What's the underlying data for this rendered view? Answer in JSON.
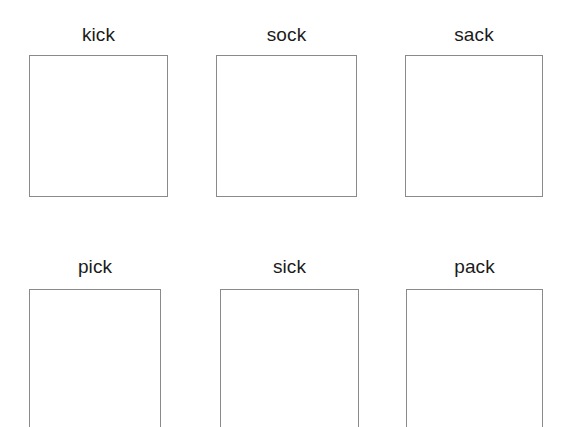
{
  "page": {
    "background_color": "#ffffff",
    "width": 571,
    "height": 427
  },
  "style": {
    "label_color": "#1b1b1b",
    "box_border_color": "#8a8a8a",
    "box_fill_color": "#ffffff"
  },
  "grid": {
    "rows": [
      {
        "row_index": 1,
        "cells": [
          {
            "id": "kick",
            "label": "kick",
            "box_content": ""
          },
          {
            "id": "sock",
            "label": "sock",
            "box_content": ""
          },
          {
            "id": "sack",
            "label": "sack",
            "box_content": ""
          }
        ]
      },
      {
        "row_index": 2,
        "cells": [
          {
            "id": "pick",
            "label": "pick",
            "box_content": ""
          },
          {
            "id": "sick",
            "label": "sick",
            "box_content": ""
          },
          {
            "id": "pack",
            "label": "pack",
            "box_content": ""
          }
        ]
      }
    ]
  }
}
